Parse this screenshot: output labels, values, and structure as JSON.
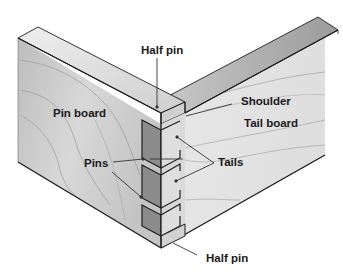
{
  "diagram": {
    "labels": {
      "half_pin_top": "Half pin",
      "pin_board": "Pin board",
      "shoulder": "Shoulder",
      "tail_board": "Tail board",
      "pins": "Pins",
      "tails": "Tails",
      "half_pin_bottom": "Half pin"
    },
    "colors": {
      "background": "#ffffff",
      "outline": "#1e1e1e",
      "pin_board_face": "#c9c9c9",
      "pin_board_top": "#dcdcdc",
      "tail_board_face": "#e6e6e6",
      "tail_board_top": "#a8a8a8",
      "socket_dark": "#8a8a8a",
      "end_grain_light": "#d6d6d6",
      "grain_line": "#9a9a9a",
      "leader_line": "#333333"
    }
  }
}
